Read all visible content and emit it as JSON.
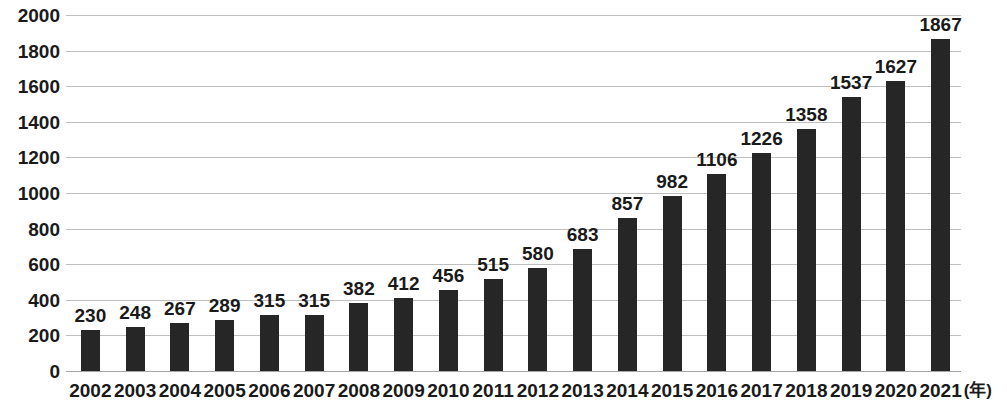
{
  "chart_data": {
    "type": "bar",
    "title": "",
    "subtitle": "",
    "xlabel": "年",
    "ylabel": "",
    "categories": [
      "2002",
      "2003",
      "2004",
      "2005",
      "2006",
      "2007",
      "2008",
      "2009",
      "2010",
      "2011",
      "2012",
      "2013",
      "2014",
      "2015",
      "2016",
      "2017",
      "2018",
      "2019",
      "2020",
      "2021"
    ],
    "values": [
      230,
      248,
      267,
      289,
      315,
      315,
      382,
      412,
      456,
      515,
      580,
      683,
      857,
      982,
      1106,
      1226,
      1358,
      1537,
      1627,
      1867
    ],
    "data_labels": [
      "230",
      "248",
      "267",
      "289",
      "315",
      "315",
      "382",
      "412",
      "456",
      "515",
      "580",
      "683",
      "857",
      "982",
      "1106",
      "1226",
      "1358",
      "1537",
      "1627",
      "1867"
    ],
    "ylim": [
      0,
      2000
    ],
    "y_ticks": [
      0,
      200,
      400,
      600,
      800,
      1000,
      1200,
      1400,
      1600,
      1800,
      2000
    ],
    "y_tick_labels": [
      "0",
      "200",
      "400",
      "600",
      "800",
      "1000",
      "1200",
      "1400",
      "1600",
      "1800",
      "2000"
    ],
    "x_tick_labels": [
      "2002",
      "2003",
      "2004",
      "2005",
      "2006",
      "2007",
      "2008",
      "2009",
      "2010",
      "2011",
      "2012",
      "2013",
      "2014",
      "2015",
      "2016",
      "2017",
      "2018",
      "2019",
      "2020",
      "2021"
    ],
    "x_axis_unit_label": "(年)",
    "grid": true,
    "grid_axis": "y",
    "legend": false,
    "legend_position": "none",
    "series": [
      {
        "name": "",
        "values": [
          230,
          248,
          267,
          289,
          315,
          315,
          382,
          412,
          456,
          515,
          580,
          683,
          857,
          982,
          1106,
          1226,
          1358,
          1537,
          1627,
          1867
        ]
      }
    ],
    "colors": {
      "bar": "#262626",
      "gridline": "#bfbfbf",
      "axis": "#a6a6a6",
      "text": "#1a1a1a",
      "background": "#ffffff"
    }
  }
}
